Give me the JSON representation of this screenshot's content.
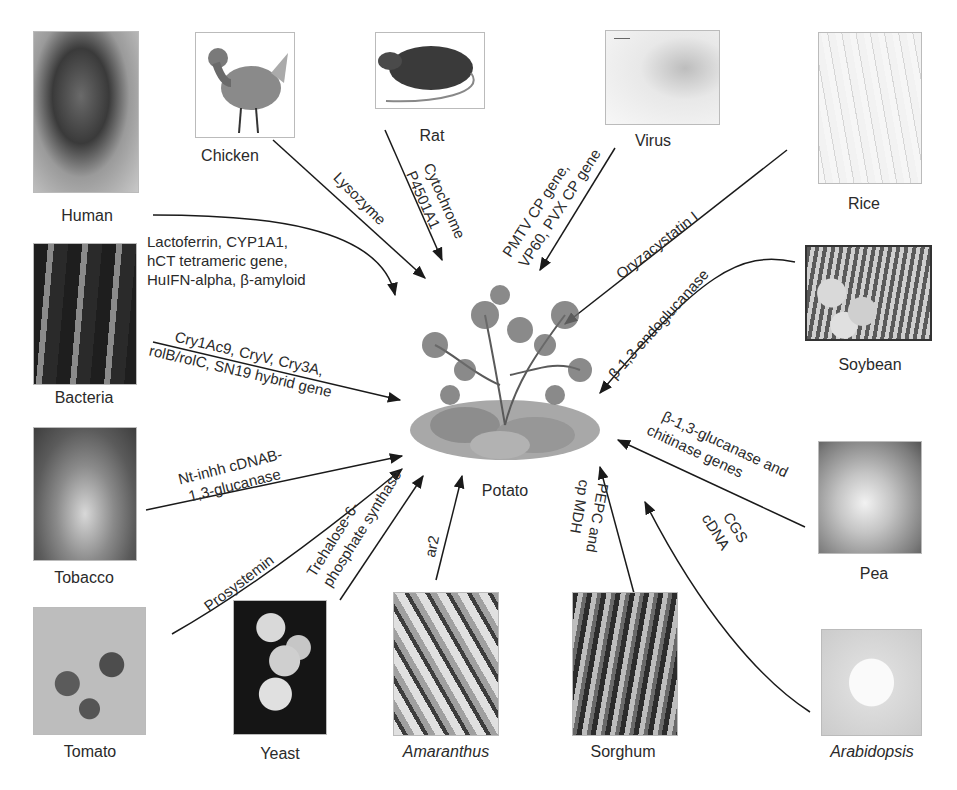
{
  "center": {
    "label": "Potato",
    "icon": "potato-plant-illustration"
  },
  "organisms": [
    {
      "id": "human",
      "label": "Human",
      "italic": false,
      "icon": "human-sculpture-photo"
    },
    {
      "id": "chicken",
      "label": "Chicken",
      "italic": false,
      "icon": "chicken-illustration"
    },
    {
      "id": "rat",
      "label": "Rat",
      "italic": false,
      "icon": "rat-illustration"
    },
    {
      "id": "virus",
      "label": "Virus",
      "italic": false,
      "icon": "virus-micrograph"
    },
    {
      "id": "rice",
      "label": "Rice",
      "italic": false,
      "icon": "rice-botanical-drawing"
    },
    {
      "id": "bacteria",
      "label": "Bacteria",
      "italic": false,
      "icon": "bacteria-micrograph"
    },
    {
      "id": "soybean",
      "label": "Soybean",
      "italic": false,
      "icon": "soybean-photo"
    },
    {
      "id": "tobacco",
      "label": "Tobacco",
      "italic": false,
      "icon": "tobacco-plant-photo"
    },
    {
      "id": "pea",
      "label": "Pea",
      "italic": false,
      "icon": "pea-plant-photo"
    },
    {
      "id": "tomato",
      "label": "Tomato",
      "italic": false,
      "icon": "tomato-photo"
    },
    {
      "id": "yeast",
      "label": "Yeast",
      "italic": false,
      "icon": "yeast-micrograph"
    },
    {
      "id": "amaranthus",
      "label": "Amaranthus",
      "italic": true,
      "icon": "amaranthus-photo"
    },
    {
      "id": "sorghum",
      "label": "Sorghum",
      "italic": false,
      "icon": "sorghum-photo"
    },
    {
      "id": "arabidopsis",
      "label": "Arabidopsis",
      "italic": true,
      "icon": "arabidopsis-photo"
    }
  ],
  "genes": {
    "human": [
      "Lactoferrin, CYP1A1,",
      "hCT tetrameric gene,",
      "HuIFN-alpha, β-amyloid"
    ],
    "chicken": [
      "Lysozyme"
    ],
    "rat": [
      "Cytochrome",
      "P4501A1"
    ],
    "virus": [
      "PMTV CP gene,",
      "VP60, PVX CP gene"
    ],
    "rice": [
      "Oryzacystatin I"
    ],
    "bacteria": [
      "Cry1Ac9, CryV, Cry3A,",
      "rolB/rolC, SN19 hybrid gene"
    ],
    "soybean": [
      "β-1,3-endoglucanase"
    ],
    "tobacco": [
      "Nt-inhh cDNAB-",
      "1,3-glucanase"
    ],
    "pea": [
      "β-1,3-glucanase and",
      "chitinase genes"
    ],
    "tomato": [
      "Prosystemin"
    ],
    "yeast": [
      "Trehalose-6-",
      "phosphate synthase"
    ],
    "amaranthus": [
      "ar2"
    ],
    "sorghum": [
      "PEPC and",
      "cp MDH"
    ],
    "arabidopsis": [
      "CGS",
      "cDNA"
    ]
  },
  "colors": {
    "line": "#1a1a1a",
    "text": "#2a2a2a",
    "background": "#ffffff"
  }
}
